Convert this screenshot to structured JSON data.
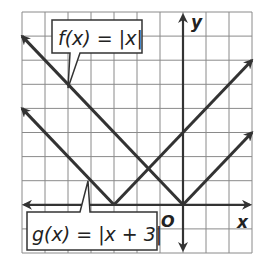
{
  "chart_data": {
    "type": "line",
    "title": "",
    "xlabel": "x",
    "ylabel": "y",
    "origin_label": "O",
    "xlim": [
      -7,
      3
    ],
    "ylim": [
      -2,
      8
    ],
    "grid": true,
    "grid_step": 1,
    "series": [
      {
        "name": "f(x) = |x|",
        "label": "f(x) = |x|",
        "formula": "|x|",
        "vertex": [
          0,
          0
        ],
        "points": [
          [
            -7,
            7
          ],
          [
            0,
            0
          ],
          [
            3,
            3
          ]
        ]
      },
      {
        "name": "g(x) = |x + 3|",
        "label": "g(x) = |x + 3|",
        "formula": "|x + 3|",
        "vertex": [
          -3,
          0
        ],
        "points": [
          [
            -7,
            4
          ],
          [
            -3,
            0
          ],
          [
            3,
            6
          ]
        ]
      }
    ],
    "annotations": [
      {
        "text": "f(x) = |x|",
        "points_to": [
          -5,
          5
        ]
      },
      {
        "text": "g(x) = |x + 3|",
        "points_to": [
          -4,
          1
        ]
      }
    ]
  },
  "labels": {
    "f": {
      "name": "f",
      "paren": "(x)",
      "eq": " = ",
      "abs": "|x|"
    },
    "g": {
      "name": "g",
      "paren": "(x)",
      "eq": " = ",
      "abs": "|x + 3|"
    },
    "x_axis": "x",
    "y_axis": "y",
    "origin": "O"
  },
  "colors": {
    "grid": "#8a8a8a",
    "lines": "#333333",
    "axes": "#333333",
    "background": "#ffffff"
  }
}
